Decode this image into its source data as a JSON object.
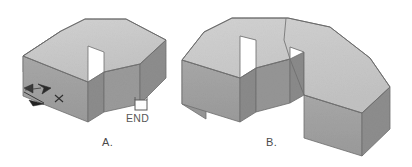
{
  "figure": {
    "caption_a": "A.",
    "caption_b": "B.",
    "end_marker_label": "END",
    "marker_x_label": "×",
    "colors": {
      "top_face": "#c7c7c7",
      "top_face_light": "#cdcdcd",
      "side_face": "#9b9b9b",
      "side_face_dark": "#8f8f8f",
      "front_face": "#a4a4a4",
      "outline": "#6f6f6f",
      "outline_soft": "#8a8a8a",
      "background": "#ffffff",
      "label_text": "#4a4a4a",
      "arrow_marker": "#2b2b2b",
      "end_square_fill": "#ffffff",
      "end_square_stroke": "#5a5a5a"
    },
    "shapes": [
      {
        "id": "shape-a",
        "name": "L-shaped isometric block A",
        "label": "A.",
        "annotations": [
          "arrow-marker",
          "x-marker",
          "end-marker"
        ]
      },
      {
        "id": "shape-b",
        "name": "U-shaped isometric block B",
        "label": "B.",
        "annotations": [
          "partition-line"
        ]
      }
    ]
  }
}
